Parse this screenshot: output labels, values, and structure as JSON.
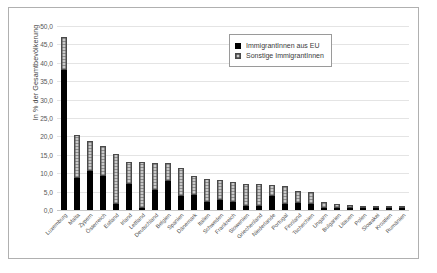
{
  "chart_data": {
    "type": "bar",
    "subtype": "stacked-bar",
    "title": "",
    "xlabel": "",
    "ylabel": "In % der Gesamtbevölkerung",
    "ylim": [
      0,
      50
    ],
    "ytick_step": 5,
    "ytick_labels": [
      "50,0",
      "45,0",
      "40,0",
      "35,0",
      "30,0",
      "25,0",
      "20,0",
      "15,0",
      "10,0",
      "5,0",
      "0,0"
    ],
    "grid": true,
    "legend_position": "top-right",
    "categories": [
      "Luxemburg",
      "Malta",
      "Zypern",
      "Österreich",
      "Estland",
      "Irland",
      "Lettland",
      "Deutschland",
      "Belgien",
      "Spanien",
      "Dänemark",
      "Italien",
      "Schweden",
      "Frankreich",
      "Slowenien",
      "Griechenland",
      "Niederlande",
      "Portugal",
      "Finnland",
      "Tschechien",
      "Ungarn",
      "Bulgarien",
      "Litauen",
      "Polen",
      "Slowakei",
      "Kroatien",
      "Rumänien"
    ],
    "series": [
      {
        "name": "ImmigrantInnen aus EU",
        "color": "#000000",
        "values": [
          38.0,
          8.6,
          10.5,
          9.2,
          1.5,
          7.0,
          0.4,
          5.5,
          7.9,
          3.8,
          4.0,
          2.2,
          2.7,
          2.2,
          1.0,
          1.0,
          3.8,
          1.5,
          1.8,
          1.7,
          0.3,
          0.2,
          0.1,
          0.2,
          0.2,
          0.1,
          0.1
        ]
      },
      {
        "name": "Sonstige ImmigrantInnen",
        "color": "#c9c9c9",
        "values": [
          9.0,
          11.9,
          8.3,
          8.3,
          13.6,
          6.1,
          12.5,
          7.4,
          4.8,
          7.5,
          5.2,
          6.3,
          5.4,
          5.5,
          6.2,
          6.0,
          3.1,
          5.1,
          3.3,
          3.1,
          1.5,
          1.0,
          0.8,
          0.6,
          0.6,
          0.5,
          0.1
        ]
      }
    ],
    "totals": [
      47.0,
      20.5,
      18.8,
      17.5,
      15.1,
      13.1,
      12.9,
      12.9,
      12.7,
      11.3,
      9.2,
      8.5,
      8.1,
      7.7,
      7.2,
      7.0,
      6.9,
      6.6,
      5.1,
      4.8,
      1.8,
      1.2,
      0.9,
      0.8,
      0.8,
      0.6,
      0.2
    ]
  },
  "legend": {
    "items": [
      {
        "label": "ImmigrantInnen aus EU"
      },
      {
        "label": "Sonstige ImmigrantInnen"
      }
    ]
  }
}
